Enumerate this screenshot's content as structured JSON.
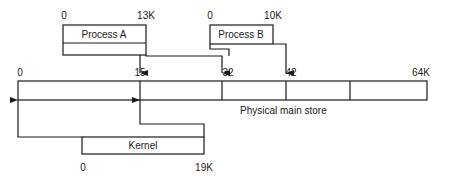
{
  "diagram": {
    "type": "memory-mapping",
    "main_store": {
      "label": "Physical main store",
      "ticks": [
        {
          "label": "0",
          "x": 18
        },
        {
          "label": "15",
          "x": 140
        },
        {
          "label": "32",
          "x": 222
        },
        {
          "label": "42",
          "x": 286
        },
        {
          "label": "64K",
          "x": 427
        }
      ]
    },
    "process_a": {
      "label": "Process A",
      "start": "0",
      "end": "13K"
    },
    "process_b": {
      "label": "Process B",
      "start": "0",
      "end": "10K"
    },
    "kernel": {
      "label": "Kernel",
      "start": "0",
      "end": "19K"
    }
  }
}
